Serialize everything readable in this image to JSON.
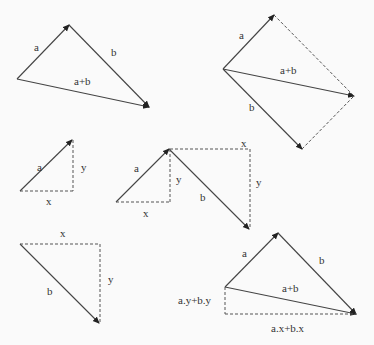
{
  "diagrams": [
    {
      "id": "triangle-sum",
      "labels": {
        "a": "a",
        "b": "b",
        "sum": "a+b"
      }
    },
    {
      "id": "parallelogram-sum",
      "labels": {
        "a": "a",
        "b": "b",
        "sum": "a+b"
      }
    },
    {
      "id": "components-a",
      "labels": {
        "a": "a",
        "x": "x",
        "y": "y"
      }
    },
    {
      "id": "components-chain",
      "labels": {
        "a": "a",
        "b": "b",
        "x1": "x",
        "y1": "y",
        "x2": "x",
        "y2": "y"
      }
    },
    {
      "id": "components-b",
      "labels": {
        "b": "b",
        "x": "x",
        "y": "y"
      }
    },
    {
      "id": "component-sum",
      "labels": {
        "a": "a",
        "b": "b",
        "sum": "a+b",
        "ysum": "a.y+b.y",
        "xsum": "a.x+b.x"
      }
    }
  ],
  "colors": {
    "line": "#444444",
    "background": "#fafafa"
  }
}
